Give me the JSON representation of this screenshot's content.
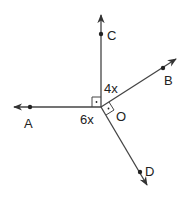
{
  "diagram": {
    "type": "geometry-rays",
    "vertex": {
      "label": "O",
      "x": 101,
      "y": 107
    },
    "rays": [
      {
        "name": "OC",
        "point_label": "C",
        "direction": "up"
      },
      {
        "name": "OB",
        "point_label": "B",
        "direction": "upper-right"
      },
      {
        "name": "OD",
        "point_label": "D",
        "direction": "lower-right"
      },
      {
        "name": "OA",
        "point_label": "A",
        "direction": "left"
      }
    ],
    "angle_labels": {
      "cob": "4x",
      "aod": "6x"
    },
    "right_angles": [
      "AOC",
      "BOD"
    ],
    "point_labels": {
      "A": "A",
      "B": "B",
      "C": "C",
      "D": "D",
      "O": "O"
    },
    "colors": {
      "line": "#333333",
      "text": "#222222",
      "background": "#ffffff"
    }
  }
}
